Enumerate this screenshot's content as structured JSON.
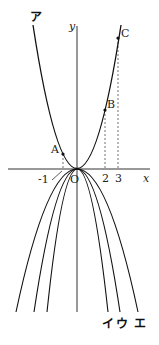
{
  "diagram": {
    "axes": {
      "x_label": "x",
      "y_label": "y",
      "origin_label": "O",
      "ticks": [
        "-1",
        "2",
        "3"
      ]
    },
    "points": {
      "A": "A",
      "B": "B",
      "C": "C"
    },
    "curves": {
      "a": "ア",
      "i": "イ",
      "u": "ウ",
      "e": "エ"
    },
    "colors": {
      "line": "#111111",
      "background": "#ffffff"
    }
  }
}
